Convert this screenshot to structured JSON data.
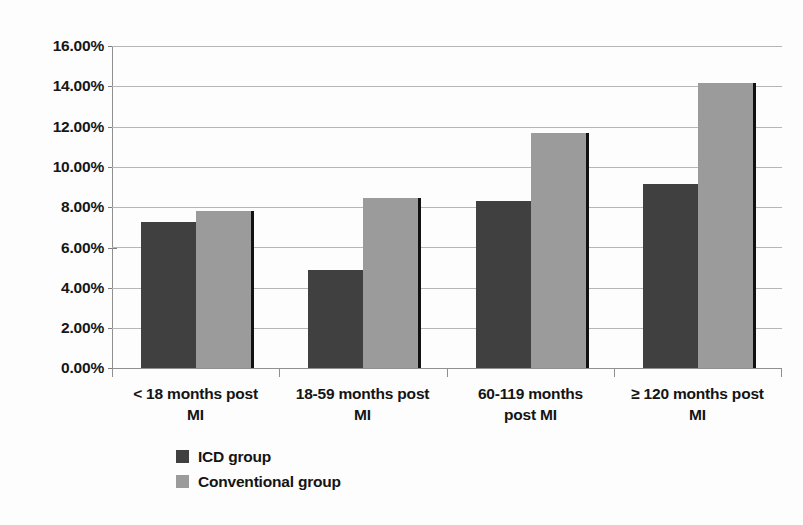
{
  "chart_data": {
    "type": "bar",
    "title": "",
    "subtitle": "",
    "xlabel": "",
    "ylabel": "",
    "ylim": [
      0,
      16
    ],
    "grid": true,
    "grid_axis": "y",
    "legend_position": "bottom-left",
    "value_format": "percent",
    "categories": [
      "< 18 months post MI",
      "18-59 months post MI",
      "60-119 months post MI",
      "≥ 120 months post MI"
    ],
    "category_lines": [
      [
        "< 18 months post",
        "MI"
      ],
      [
        "18-59 months post",
        "MI"
      ],
      [
        "60-119 months",
        "post MI"
      ],
      [
        "≥ 120 months post",
        "MI"
      ]
    ],
    "ytick_labels": [
      "16.00%",
      "14.00%",
      "12.00%",
      "10.00%",
      "8.00%",
      "6.00%",
      "4.00%",
      "2.00%",
      "0.00%"
    ],
    "ytick_values": [
      16,
      14,
      12,
      10,
      8,
      6,
      4,
      2,
      0
    ],
    "series": [
      {
        "name": "ICD group",
        "color": "#404040",
        "values": [
          7.25,
          4.88,
          8.3,
          9.12
        ]
      },
      {
        "name": "Conventional group",
        "color": "#9b9b9b",
        "values": [
          7.78,
          8.45,
          11.7,
          14.15
        ]
      }
    ]
  },
  "legend": {
    "items": [
      {
        "label": "ICD group",
        "color": "#404040"
      },
      {
        "label": "Conventional group",
        "color": "#9b9b9b"
      }
    ]
  },
  "colors": {
    "icd": "#404040",
    "conventional": "#9b9b9b",
    "gridline": "#b6b6b6",
    "axis": "#8f8f8f",
    "background": "#fdfdfd",
    "text": "#141414"
  }
}
